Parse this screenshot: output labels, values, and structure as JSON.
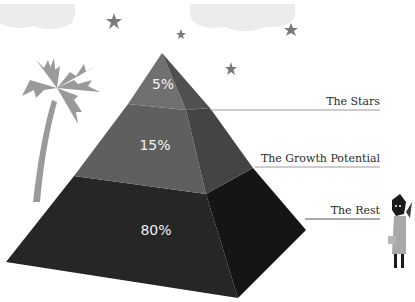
{
  "diagram": {
    "type": "pyramid",
    "levels": [
      {
        "id": "top",
        "percent": "5%",
        "label": "The Stars",
        "color": "#6e6e6e",
        "side_color": "#4d4d4d"
      },
      {
        "id": "middle",
        "percent": "15%",
        "label": "The Growth Potential",
        "color": "#5f5f5f",
        "side_color": "#3e3e3e"
      },
      {
        "id": "bottom",
        "percent": "80%",
        "label": "The Rest",
        "color": "#262626",
        "side_color": "#151515"
      }
    ],
    "decorations": [
      "palm-tree",
      "stars",
      "clouds",
      "figure-with-briefcase"
    ]
  }
}
